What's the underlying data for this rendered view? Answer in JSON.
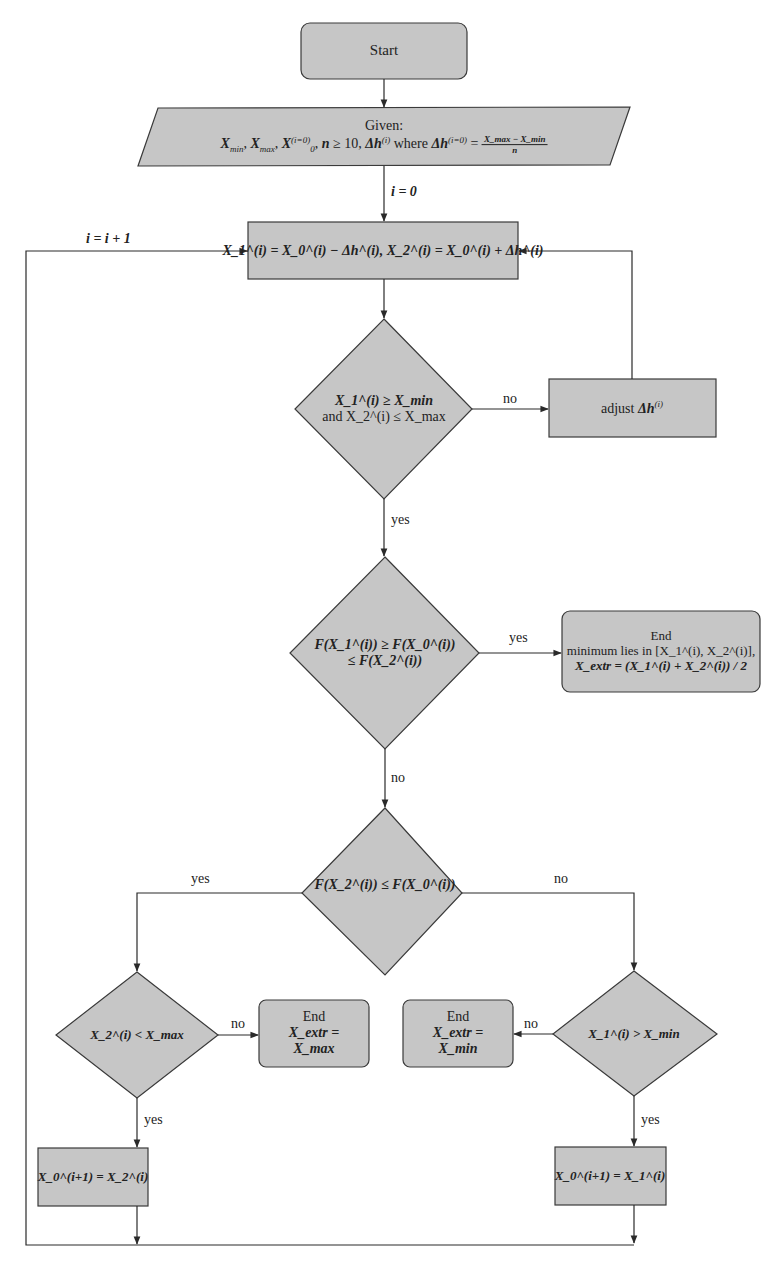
{
  "diagram": {
    "type": "flowchart",
    "colors": {
      "fill": "#c6c6c6",
      "stroke": "#3a3a3a",
      "background": "#ffffff"
    },
    "nodes": {
      "start": {
        "text": "Start"
      },
      "given": {
        "title": "Given:",
        "text": "X_min, X_max, X_0^(i=0), n ≥ 10, Δh^(i) where Δh^(i=0) = (X_max − X_min)/n",
        "p1": "X",
        "p1s": "min",
        "p2": "X",
        "p2s": "max",
        "p3": "X",
        "p3sub": "0",
        "p3sup": "(i=0)",
        "p4": "n",
        "p4b": " ≥ 10, ",
        "p5": "Δh",
        "p5sup": "(i)",
        "where": " where ",
        "p6": "Δh",
        "p6sup": "(i=0)",
        "eq": " = ",
        "frac_num": "X_max − X_min",
        "frac_den": "n"
      },
      "update": {
        "text": "X_1^(i) = X_0^(i) − Δh^(i), X_2^(i) = X_0^(i) + Δh^(i)"
      },
      "check_bounds": {
        "line1": "X_1^(i) ≥ X_min",
        "line2": "and X_2^(i) ≤ X_max"
      },
      "adjust": {
        "prefix": "adjust ",
        "text": "Δh",
        "sup": "(i)"
      },
      "check_min": {
        "line1": "F(X_1^(i)) ≥ F(X_0^(i))",
        "line2": "≤ F(X_2^(i))"
      },
      "end_interval": {
        "line1": "End",
        "line2": "minimum lies in [X_1^(i), X_2^(i)],",
        "line3": "X_extr = (X_1^(i) + X_2^(i)) / 2"
      },
      "check_f2": {
        "text": "F(X_2^(i)) ≤ F(X_0^(i))"
      },
      "check_x2max": {
        "text": "X_2^(i) < X_max"
      },
      "end_max": {
        "line1": "End",
        "line2": "X_extr =",
        "line3": "X_max"
      },
      "end_min": {
        "line1": "End",
        "line2": "X_extr =",
        "line3": "X_min"
      },
      "check_x1min": {
        "text": "X_1^(i) > X_min"
      },
      "set_x2": {
        "text": "X_0^(i+1) = X_2^(i)"
      },
      "set_x1": {
        "text": "X_0^(i+1) = X_1^(i)"
      }
    },
    "edge_labels": {
      "init": "i = 0",
      "loop": "i = i + 1",
      "bounds_no": "no",
      "bounds_yes": "yes",
      "min_yes": "yes",
      "min_no": "no",
      "f2_yes": "yes",
      "f2_no": "no",
      "x2max_no": "no",
      "x2max_yes": "yes",
      "x1min_no": "no",
      "x1min_yes": "yes"
    }
  }
}
